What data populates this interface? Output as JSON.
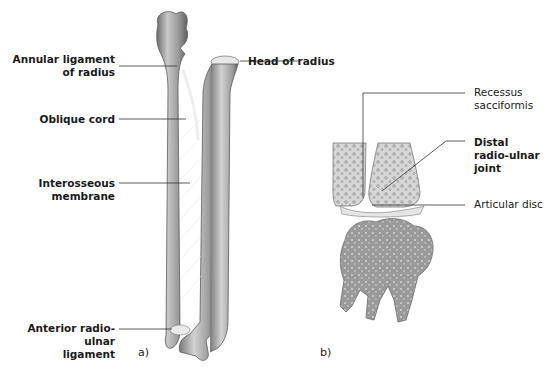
{
  "figure": {
    "panel_a": {
      "letter": "a)",
      "labels": {
        "annular_ligament": [
          "Annular ligament",
          "of radius"
        ],
        "head_of_radius": "Head of radius",
        "oblique_cord": "Oblique cord",
        "interosseous_membrane": [
          "Interosseous",
          "membrane"
        ],
        "anterior_radio_ulnar_ligament": [
          "Anterior radio-ulnar",
          "ligament"
        ]
      }
    },
    "panel_b": {
      "letter": "b)",
      "labels": {
        "recessus_sacciformis": [
          "Recessus",
          "sacciformis"
        ],
        "distal_radio_ulnar_joint": [
          "Distal",
          "radio-ulnar",
          "joint"
        ],
        "articular_disc": "Articular disc"
      }
    },
    "colors": {
      "bone_light": "#d9d9d9",
      "bone_mid": "#a8a8a8",
      "bone_dark": "#6e6e6e",
      "leader_line": "#333333",
      "text": "#1a1a1a"
    }
  }
}
